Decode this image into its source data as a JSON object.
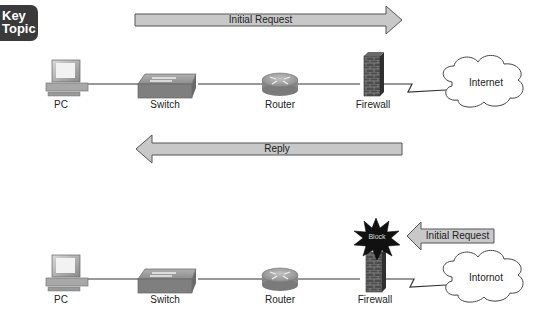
{
  "badge": {
    "line1": "Key",
    "line2": "Topic"
  },
  "scenario_allowed": {
    "request_arrow": {
      "label": "Initial Request",
      "direction": "right"
    },
    "reply_arrow": {
      "label": "Reply",
      "direction": "left"
    },
    "devices": [
      {
        "id": "pc",
        "label": "PC"
      },
      {
        "id": "switch",
        "label": "Switch"
      },
      {
        "id": "router",
        "label": "Router"
      },
      {
        "id": "firewall",
        "label": "Firewall"
      },
      {
        "id": "cloud",
        "label": "Internet"
      }
    ]
  },
  "scenario_blocked": {
    "request_arrow": {
      "label": "Initial Request",
      "direction": "left"
    },
    "block_burst": {
      "label": "Block"
    },
    "devices": [
      {
        "id": "pc",
        "label": "PC"
      },
      {
        "id": "switch",
        "label": "Switch"
      },
      {
        "id": "router",
        "label": "Router"
      },
      {
        "id": "firewall",
        "label": "Firewall"
      },
      {
        "id": "cloud",
        "label": "Intornot"
      }
    ]
  },
  "colors": {
    "arrow_fill": "#c8c8c8",
    "arrow_stroke": "#555555",
    "firewall_brick": "#4a4a4a",
    "burst": "#111111",
    "badge_bg": "#3a3a3a"
  }
}
